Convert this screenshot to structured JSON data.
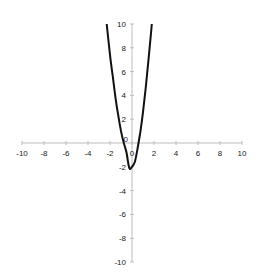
{
  "chart_data": {
    "type": "line",
    "title": "",
    "xlabel": "",
    "ylabel": "",
    "xlim": [
      -10,
      10
    ],
    "ylim": [
      -10,
      10
    ],
    "grid": false,
    "legend": null,
    "x_ticks": [
      -10,
      -8,
      -6,
      -4,
      -2,
      0,
      2,
      4,
      6,
      8,
      10
    ],
    "y_ticks": [
      -10,
      -8,
      -6,
      -4,
      -2,
      0,
      2,
      4,
      6,
      8,
      10
    ],
    "x_tick_labels": [
      "-10",
      "-8",
      "-6",
      "-4",
      "-2",
      "0",
      "2",
      "4",
      "6",
      "8",
      "10"
    ],
    "y_tick_labels": [
      "-10",
      "-8",
      "-6",
      "-4",
      "-2",
      "0",
      "2",
      "4",
      "6",
      "8",
      "10"
    ],
    "series": [
      {
        "name": "parabola",
        "color": "#111111",
        "x": [
          -2.3,
          -2.0,
          -1.75,
          -1.5,
          -1.25,
          -1.0,
          -0.75,
          -0.5,
          -0.25,
          0.0,
          0.25,
          0.5,
          0.75,
          1.0,
          1.25,
          1.5,
          1.75,
          1.8
        ],
        "y": [
          10.0,
          7.4,
          5.6,
          3.8,
          2.3,
          1.0,
          0.0,
          -0.8,
          -2.1,
          -2.0,
          -1.6,
          -0.5,
          0.9,
          2.6,
          4.7,
          7.0,
          9.5,
          10.0
        ]
      }
    ]
  },
  "plot": {
    "x_axis_y_px": 144,
    "y_axis_x_px": 132,
    "x_min_px": 22,
    "x_max_px": 242,
    "y_top_px": 24,
    "y_bottom_px": 262
  }
}
